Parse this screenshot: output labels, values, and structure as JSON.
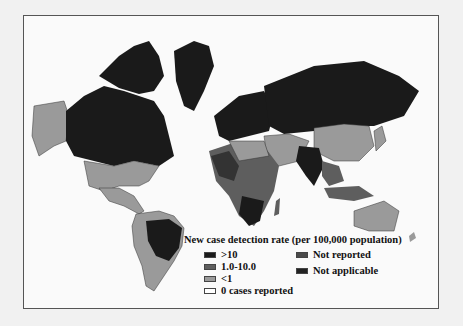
{
  "map": {
    "title": "New case detection rate (per 100,000 population)",
    "colors": {
      "gt10": "#1a1a1a",
      "r1_10": "#5e5e5e",
      "lt1": "#9a9a9a",
      "zero": "#ffffff",
      "not_reported": "#4a4a4a",
      "not_applicable": "#222222"
    }
  },
  "legend": {
    "title": "New case detection rate (per 100,000 population)",
    "items": [
      {
        "label": ">10",
        "color": "#1a1a1a"
      },
      {
        "label": "1.0-10.0",
        "color": "#5e5e5e"
      },
      {
        "label": "<1",
        "color": "#9a9a9a"
      },
      {
        "label": "0 cases reported",
        "color": "#ffffff"
      },
      {
        "label": "Not reported",
        "color": "#4a4a4a"
      },
      {
        "label": "Not applicable",
        "color": "#222222"
      }
    ]
  }
}
